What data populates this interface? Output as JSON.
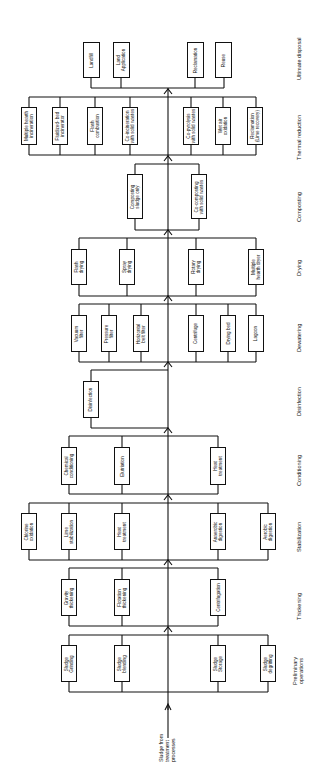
{
  "diagram": {
    "orientation": "rotated 90deg counter-clockwise, flow bottom to top",
    "source_label": "Sludge from\ntreatment\nprocesses",
    "stages": [
      {
        "name": "Preliminary\noperations",
        "options": [
          "Sludge\nGrinding",
          "Sludge\nblending",
          "Sludge\nStorage",
          "Sludge\ndegritting"
        ]
      },
      {
        "name": "Thickening",
        "options": [
          "Gravity\nthickening",
          "Flotation\nthickening",
          "Centrifugation"
        ]
      },
      {
        "name": "Stabilization",
        "options": [
          "Chlorine\noxidation",
          "Lime\nstabilization",
          "Heat\ntreatment",
          "Anaerobic\ndigestion",
          "Aerobic\ndigestion"
        ]
      },
      {
        "name": "Conditioning",
        "options": [
          "Chemical\nconditioning",
          "Elutriation",
          "Heat\ntreatment"
        ]
      },
      {
        "name": "Disinfection",
        "options": [
          "Disinfection"
        ]
      },
      {
        "name": "Dewatering",
        "options": [
          "Vacuum\nfilter",
          "Pressure\nfilter",
          "Horizontal\nbelt filter",
          "Centrifuge",
          "Drying bed",
          "Lagoon"
        ]
      },
      {
        "name": "Drying",
        "options": [
          "Flash\ndrying",
          "Spray\ndrying",
          "Rotary\ndrying",
          "Multiple\nhearth dryer"
        ]
      },
      {
        "name": "Composting",
        "options": [
          "Composting\nsludge only",
          "Co-composting\nwith solid wastes"
        ]
      },
      {
        "name": "Thermal reduction",
        "options": [
          "Multiple hearth\nincineration",
          "Fluidized- bed\nincinerator",
          "Flash\ncombustion",
          "Co-incineration\nwith solid wastes",
          "Co-pyrolysis\nwith solid wastes",
          "Wet air\noxidation",
          "Reclamation\n(Lime recovery)"
        ]
      },
      {
        "name": "Ultimate disposal",
        "options": [
          "Landfill",
          "Land\nApplication",
          "Reclamation",
          "Reuse"
        ]
      }
    ]
  }
}
